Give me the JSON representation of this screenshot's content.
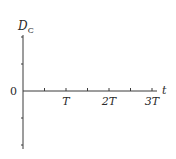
{
  "chart_data": {
    "type": "line",
    "title": "",
    "ylabel": "D",
    "ylabel_sub": "C",
    "xlabel": "t",
    "origin_label": "0",
    "x_ticks": [
      {
        "pos": 0.5,
        "label": ""
      },
      {
        "pos": 1,
        "label": "T"
      },
      {
        "pos": 1.5,
        "label": ""
      },
      {
        "pos": 2,
        "label": "2T"
      },
      {
        "pos": 2.5,
        "label": ""
      },
      {
        "pos": 3,
        "label": "3T"
      }
    ],
    "y_ticks": [
      2,
      1,
      0,
      -1,
      -2
    ],
    "xlim": [
      0,
      3.2
    ],
    "ylim": [
      -2.1,
      2.1
    ],
    "grid": false,
    "series": []
  }
}
